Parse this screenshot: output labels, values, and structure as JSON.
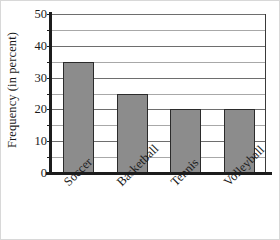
{
  "chart_data": {
    "type": "bar",
    "title": "",
    "xlabel": "",
    "ylabel": "Frequency (in percent)",
    "categories": [
      "Soccer",
      "Basketball",
      "Tennis",
      "Volleyball"
    ],
    "values": [
      35,
      25,
      20,
      20
    ],
    "ylim": [
      0,
      50
    ],
    "ytick_labels": [
      "0",
      "10",
      "20",
      "30",
      "40",
      "50"
    ],
    "ytick_values": [
      0,
      10,
      20,
      30,
      40,
      50
    ],
    "minor_tick_step": 5,
    "grid": true,
    "grid_axis": "y",
    "legend": "none",
    "bar_color": "#8c8c8c",
    "bar_edge_color": "#2b2b2b",
    "axis_color": "#1c1c1c",
    "grid_color": "#6e6e6e"
  }
}
